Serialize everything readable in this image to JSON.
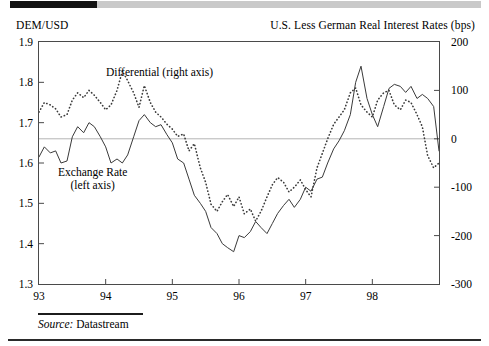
{
  "figure": {
    "left_axis_title": "DEM/USD",
    "right_axis_title": "U.S. Less German Real Interest Rates (bps)",
    "source_label": "Source:",
    "source_value": "Datastream"
  },
  "annotations": {
    "differential": "Differential (right axis)",
    "exchange_rate_line1": "Exchange Rate",
    "exchange_rate_line2": "(left axis)"
  },
  "chart_data": {
    "type": "line",
    "title": "",
    "subtitle": "",
    "xlabel": "",
    "ylabel": "DEM/USD",
    "y2label": "U.S. Less German Real Interest Rates (bps)",
    "grid": false,
    "zero_gridline": 0,
    "legend_position": "in-plot annotations",
    "xlim": [
      1993.0,
      1999.0
    ],
    "ylim": [
      1.3,
      1.9
    ],
    "y2lim": [
      -300,
      200
    ],
    "xticks": [
      93,
      94,
      95,
      96,
      97,
      98
    ],
    "xtick_labels": [
      "93",
      "94",
      "95",
      "96",
      "97",
      "98"
    ],
    "yticks": [
      1.9,
      1.8,
      1.7,
      1.6,
      1.5,
      1.4,
      1.3
    ],
    "ytick_labels": [
      "1.9",
      "1.8",
      "1.7",
      "1.6",
      "1.5",
      "1.4",
      "1.3"
    ],
    "y2ticks": [
      200,
      100,
      0,
      -100,
      -200,
      -300
    ],
    "y2tick_labels": [
      "200",
      "100",
      "0",
      "-100",
      "-200",
      "-300"
    ],
    "series": [
      {
        "name": "Exchange Rate (left axis)",
        "axis": "left",
        "style": "solid",
        "color": "#3a3a3a",
        "x": [
          1993.0,
          1993.08,
          1993.17,
          1993.25,
          1993.33,
          1993.42,
          1993.5,
          1993.58,
          1993.67,
          1993.75,
          1993.83,
          1993.92,
          1994.0,
          1994.08,
          1994.17,
          1994.25,
          1994.33,
          1994.42,
          1994.5,
          1994.58,
          1994.67,
          1994.75,
          1994.83,
          1994.92,
          1995.0,
          1995.08,
          1995.17,
          1995.25,
          1995.33,
          1995.42,
          1995.5,
          1995.58,
          1995.67,
          1995.75,
          1995.83,
          1995.92,
          1996.0,
          1996.08,
          1996.17,
          1996.25,
          1996.33,
          1996.42,
          1996.5,
          1996.58,
          1996.67,
          1996.75,
          1996.83,
          1996.92,
          1997.0,
          1997.08,
          1997.17,
          1997.25,
          1997.33,
          1997.42,
          1997.5,
          1997.58,
          1997.67,
          1997.75,
          1997.83,
          1997.92,
          1998.0,
          1998.08,
          1998.17,
          1998.25,
          1998.33,
          1998.42,
          1998.5,
          1998.58,
          1998.67,
          1998.75,
          1998.83,
          1998.92,
          1999.0
        ],
        "y": [
          1.615,
          1.64,
          1.625,
          1.63,
          1.6,
          1.605,
          1.665,
          1.69,
          1.675,
          1.7,
          1.69,
          1.665,
          1.64,
          1.6,
          1.61,
          1.6,
          1.62,
          1.665,
          1.705,
          1.72,
          1.7,
          1.69,
          1.695,
          1.67,
          1.65,
          1.61,
          1.6,
          1.56,
          1.52,
          1.5,
          1.48,
          1.44,
          1.425,
          1.4,
          1.39,
          1.38,
          1.42,
          1.415,
          1.43,
          1.455,
          1.44,
          1.425,
          1.45,
          1.475,
          1.495,
          1.51,
          1.49,
          1.51,
          1.54,
          1.53,
          1.56,
          1.565,
          1.6,
          1.635,
          1.655,
          1.68,
          1.72,
          1.8,
          1.84,
          1.76,
          1.72,
          1.69,
          1.74,
          1.785,
          1.795,
          1.79,
          1.775,
          1.79,
          1.76,
          1.77,
          1.76,
          1.74,
          1.63
        ],
        "notable": {
          "start_1993": 1.615,
          "peak_1994": 1.72,
          "trough_1995": 1.38,
          "peak_1997": 1.84,
          "end_1998": 1.63
        }
      },
      {
        "name": "Differential (right axis)",
        "axis": "right",
        "style": "dotted",
        "color": "#3a3a3a",
        "x": [
          1993.0,
          1993.08,
          1993.17,
          1993.25,
          1993.33,
          1993.42,
          1993.5,
          1993.58,
          1993.67,
          1993.75,
          1993.83,
          1993.92,
          1994.0,
          1994.08,
          1994.17,
          1994.25,
          1994.33,
          1994.42,
          1994.5,
          1994.58,
          1994.67,
          1994.75,
          1994.83,
          1994.92,
          1995.0,
          1995.08,
          1995.17,
          1995.25,
          1995.33,
          1995.42,
          1995.5,
          1995.58,
          1995.67,
          1995.75,
          1995.83,
          1995.92,
          1996.0,
          1996.08,
          1996.17,
          1996.25,
          1996.33,
          1996.42,
          1996.5,
          1996.58,
          1996.67,
          1996.75,
          1996.83,
          1996.92,
          1997.0,
          1997.08,
          1997.17,
          1997.25,
          1997.33,
          1997.42,
          1997.5,
          1997.58,
          1997.67,
          1997.75,
          1997.83,
          1997.92,
          1998.0,
          1998.08,
          1998.17,
          1998.25,
          1998.33,
          1998.42,
          1998.5,
          1998.58,
          1998.67,
          1998.75,
          1998.83,
          1998.92,
          1999.0
        ],
        "y": [
          55,
          75,
          70,
          62,
          45,
          50,
          80,
          95,
          85,
          100,
          90,
          75,
          60,
          70,
          100,
          140,
          120,
          95,
          65,
          110,
          75,
          55,
          45,
          30,
          20,
          5,
          10,
          -25,
          -10,
          -60,
          -90,
          -135,
          -150,
          -130,
          -115,
          -140,
          -120,
          -155,
          -145,
          -170,
          -150,
          -120,
          -95,
          -80,
          -90,
          -110,
          -100,
          -85,
          -105,
          -120,
          -60,
          -30,
          0,
          30,
          45,
          60,
          95,
          105,
          70,
          55,
          45,
          80,
          95,
          100,
          70,
          60,
          80,
          75,
          50,
          25,
          -35,
          -60,
          -50
        ],
        "notable": {
          "start_1993": 55,
          "peak_1994": 140,
          "trough_1996": -170,
          "peak_1997": 105,
          "end_1998": -50
        }
      }
    ]
  },
  "colors": {
    "frame": "#4a4a4a",
    "line": "#3a3a3a",
    "zero_gridline": "#b4b4b4",
    "top_rule_black": "#121212",
    "top_rule_gray": "#c9c9c9",
    "footer_rule": "#1c1c1c"
  }
}
